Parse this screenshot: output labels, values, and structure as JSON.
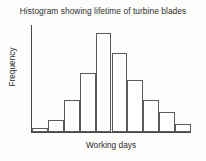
{
  "chart_data": {
    "type": "bar",
    "title": "Histogram showing lifetime of turbine blades",
    "xlabel": "Working days",
    "ylabel": "Frequency",
    "categories": [
      "1",
      "2",
      "3",
      "4",
      "5",
      "6",
      "7",
      "8",
      "9",
      "10"
    ],
    "values": [
      1,
      3,
      8,
      15,
      25,
      20,
      13,
      8,
      5,
      2
    ],
    "ylim": [
      0,
      27
    ],
    "grid": false,
    "legend": false,
    "axis_tick_labels": false,
    "bar_fill_color": "#ffffff",
    "bar_edge_color": "#5a5a5a",
    "axis_color": "#4a4a4a",
    "text_color": "#2b2b2b",
    "background_color": "#fdfdfc"
  }
}
